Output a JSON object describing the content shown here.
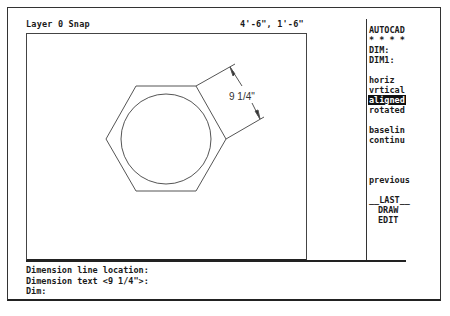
{
  "status_bar": {
    "layer_snap": "Layer 0 Snap",
    "coordinates": "4'-6\", 1'-6\""
  },
  "side_menu": {
    "items": [
      {
        "label": "AUTOCAD"
      },
      {
        "label": "* * * *"
      },
      {
        "label": "DIM:"
      },
      {
        "label": "DIM1:"
      },
      {
        "label": "horiz"
      },
      {
        "label": "vrtical"
      },
      {
        "label": "aligned",
        "selected": true
      },
      {
        "label": "rotated"
      },
      {
        "label": "baselin"
      },
      {
        "label": "continu"
      },
      {
        "label": "previous"
      },
      {
        "label": "__LAST__"
      },
      {
        "label": "DRAW"
      },
      {
        "label": "EDIT"
      }
    ]
  },
  "drawing": {
    "dimension_text": "9 1/4\"",
    "shapes": [
      "hexagon",
      "inscribed-circle",
      "aligned-dimension"
    ]
  },
  "command_area": {
    "lines": [
      "Dimension line location:",
      "Dimension text <9 1/4\">:",
      "Dim:"
    ]
  }
}
